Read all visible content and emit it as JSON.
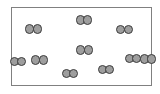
{
  "diagram": {
    "molecule_count": 10,
    "atoms_per_molecule": 2,
    "total_atoms": 20
  },
  "canvas": {
    "width": 160,
    "height": 94,
    "background_color": "#ffffff"
  },
  "container": {
    "label": "container",
    "x": 11,
    "y": 7,
    "width": 141,
    "height": 79,
    "border_width": 1.5,
    "border_color": "#808080",
    "fill_color": "#ffffff"
  },
  "atom_style": {
    "radius": 4.6,
    "diameter": 9.2,
    "fill_color": "#9e9e9e",
    "stroke_color": "#3c3c3c",
    "stroke_width": 0.9,
    "bond_overlap": 7.6
  },
  "molecules": [
    {
      "name": "molecule-1",
      "cx": 33.5,
      "cy": 29.0,
      "angle": 0
    },
    {
      "name": "molecule-2",
      "cx": 84.0,
      "cy": 20.0,
      "angle": 0
    },
    {
      "name": "molecule-3",
      "cx": 124.5,
      "cy": 29.5,
      "angle": 0
    },
    {
      "name": "molecule-4",
      "cx": 84.5,
      "cy": 50.0,
      "angle": 0
    },
    {
      "name": "molecule-5",
      "cx": 39.5,
      "cy": 60.0,
      "angle": 0
    },
    {
      "name": "molecule-6",
      "cx": 133.0,
      "cy": 58.5,
      "angle": 0
    },
    {
      "name": "molecule-7",
      "cx": 70.0,
      "cy": 73.5,
      "angle": 0
    },
    {
      "name": "molecule-8",
      "cx": 106.0,
      "cy": 69.5,
      "angle": 0
    },
    {
      "name": "molecule-9",
      "cx": 148.0,
      "cy": 59.0,
      "angle": 0
    },
    {
      "name": "molecule-10",
      "cx": 18.0,
      "cy": 61.5,
      "angle": 0
    }
  ]
}
